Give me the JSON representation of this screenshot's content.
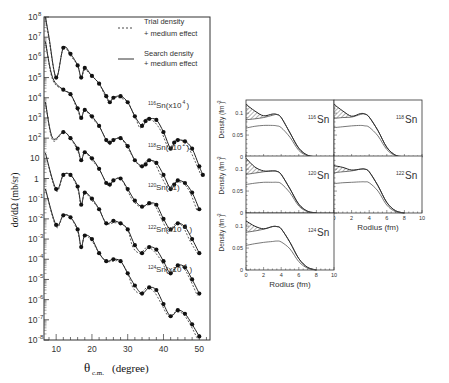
{
  "figure": {
    "left_panel": {
      "ylabel": "dσ/dΩ (mb/sr)",
      "xlabel_main": "θ",
      "xlabel_sub": "c.m.",
      "xlabel_unit": "(degree)",
      "x_ticks": [
        "10",
        "20",
        "30",
        "40",
        "50"
      ],
      "y_ticks": [
        {
          "base": "10",
          "exp": "8"
        },
        {
          "base": "10",
          "exp": "7"
        },
        {
          "base": "10",
          "exp": "6"
        },
        {
          "base": "10",
          "exp": "5"
        },
        {
          "base": "10",
          "exp": "4"
        },
        {
          "base": "10",
          "exp": "3"
        },
        {
          "base": "10",
          "exp": "2"
        },
        {
          "base": "10",
          "exp": ""
        },
        {
          "base": "1",
          "exp": ""
        },
        {
          "base": "10",
          "exp": "-1"
        },
        {
          "base": "10",
          "exp": "-2"
        },
        {
          "base": "10",
          "exp": "-3"
        },
        {
          "base": "10",
          "exp": "-4"
        },
        {
          "base": "10",
          "exp": "-5"
        },
        {
          "base": "10",
          "exp": "-6"
        },
        {
          "base": "10",
          "exp": "-7"
        },
        {
          "base": "10",
          "exp": "-8"
        }
      ],
      "legend": {
        "trial_line1": "Trial density",
        "trial_line2": "+ medium effect",
        "search_line1": "Search density",
        "search_line2": "+ medium effect"
      },
      "curve_labels": [
        {
          "mass": "116",
          "text": "Sn(x10",
          "exp": "4",
          ")": ")"
        },
        {
          "mass": "118",
          "text": "Sn(x10",
          "exp": "2"
        },
        {
          "mass": "120",
          "text": "Sn(x1)",
          "exp": ""
        },
        {
          "mass": "122",
          "text": "Sn(x10",
          "exp": "-2"
        },
        {
          "mass": "124",
          "text": "Sn(x10",
          "exp": "-4"
        }
      ]
    },
    "density_panels": {
      "ylabel": "Density (fm",
      "ylabel_exp": "-3",
      "xlabel": "Rodius (fm)",
      "y_ticks": [
        "0",
        "0.05",
        "0.1"
      ],
      "x_ticks": [
        "0",
        "2",
        "4",
        "6",
        "8",
        "10"
      ],
      "panels": [
        {
          "mass": "116",
          "element": "Sn"
        },
        {
          "mass": "118",
          "element": "Sn"
        },
        {
          "mass": "120",
          "element": "Sn"
        },
        {
          "mass": "122",
          "element": "Sn"
        },
        {
          "mass": "124",
          "element": "Sn"
        }
      ]
    }
  },
  "chart_data": [
    {
      "type": "scatter",
      "title": "Elastic scattering differential cross sections, Sn isotopes",
      "xlabel": "θ_c.m. (degree)",
      "ylabel": "dσ/dΩ (mb/sr)",
      "xlim": [
        6.6,
        53
      ],
      "ylim": [
        1e-08,
        100000000.0
      ],
      "yscale": "log",
      "legend": [
        "Trial density + medium effect (dashed)",
        "Search density + medium effect (solid)"
      ],
      "series": [
        {
          "name": "116Sn (x10^4)",
          "scale": 10000,
          "x": [
            8,
            10,
            12,
            14,
            16,
            17,
            18,
            20,
            22,
            24,
            25,
            26,
            28,
            30,
            32,
            34,
            35,
            36,
            38,
            40,
            42,
            43,
            44,
            46,
            48,
            50,
            51
          ],
          "y": [
            10000000.0,
            100000.0,
            3000000.0,
            1500000.0,
            400000.0,
            100000.0,
            300000.0,
            120000.0,
            50000.0,
            12000.0,
            6000.0,
            10000.0,
            12000.0,
            6000.0,
            1200.0,
            400.0,
            700.0,
            900.0,
            800.0,
            200.0,
            30,
            60,
            80,
            70,
            30,
            4,
            1.5
          ]
        },
        {
          "name": "118Sn (x10^2)",
          "scale": 100,
          "x": [
            9,
            12,
            14,
            16,
            17,
            18,
            20,
            22,
            24,
            25,
            26,
            28,
            30,
            32,
            34,
            35,
            36,
            38,
            40,
            42,
            43,
            44,
            46,
            48,
            50
          ],
          "y": [
            100000.0,
            25000.0,
            15000.0,
            3000.0,
            1000.0,
            2500.0,
            1200.0,
            400.0,
            80,
            60,
            80,
            100.0,
            40,
            8,
            4,
            5,
            8,
            6,
            1.5,
            0.3,
            0.5,
            0.8,
            0.6,
            0.2,
            0.03
          ]
        },
        {
          "name": "120Sn (x1)",
          "scale": 1,
          "x": [
            9,
            12,
            14,
            16,
            17,
            18,
            20,
            22,
            24,
            25,
            26,
            28,
            30,
            32,
            34,
            36,
            38,
            40,
            42,
            44,
            46,
            48,
            50
          ],
          "y": [
            100.0,
            200.0,
            100.0,
            30,
            8,
            20,
            10,
            3,
            0.6,
            0.5,
            0.8,
            1,
            0.3,
            0.08,
            0.04,
            0.06,
            0.05,
            0.01,
            0.003,
            0.006,
            0.004,
            0.001,
            0.0002
          ]
        },
        {
          "name": "122Sn (x10^-2)",
          "scale": 0.01,
          "x": [
            10,
            12,
            14,
            16,
            17,
            18,
            20,
            22,
            24,
            26,
            28,
            30,
            32,
            34,
            36,
            38,
            40,
            42,
            44,
            46,
            48,
            50
          ],
          "y": [
            0.3,
            1.5,
            1.5,
            0.4,
            0.05,
            0.2,
            0.1,
            0.03,
            0.006,
            0.008,
            0.006,
            0.003,
            0.0005,
            0.0002,
            0.0004,
            0.0003,
            8e-05,
            2e-05,
            5e-05,
            4e-05,
            1e-05,
            2e-06
          ]
        },
        {
          "name": "124Sn (x10^-4)",
          "scale": 0.0001,
          "x": [
            10,
            12,
            14,
            16,
            17,
            18,
            20,
            22,
            24,
            26,
            28,
            30,
            32,
            34,
            36,
            38,
            40,
            42,
            44,
            46,
            48,
            50
          ],
          "y": [
            0.005,
            0.015,
            0.012,
            0.003,
            0.0004,
            0.0015,
            0.001,
            0.0002,
            8e-05,
            0.0001,
            8e-05,
            2e-05,
            5e-06,
            2e-06,
            4e-06,
            3e-06,
            6e-07,
            1.5e-07,
            3e-07,
            2e-07,
            6e-08,
            1.5e-08
          ]
        }
      ]
    },
    {
      "type": "line",
      "title": "Nuclear density distributions",
      "xlabel": "Rodius (fm)",
      "ylabel": "Density (fm^-3)",
      "xlim": [
        0,
        10
      ],
      "ylim": [
        0,
        0.13
      ],
      "panels": [
        {
          "name": "116Sn",
          "r": [
            0,
            1,
            2,
            3,
            3.5,
            4,
            5,
            6,
            7,
            8
          ],
          "search": [
            0.12,
            0.105,
            0.094,
            0.098,
            0.097,
            0.09,
            0.055,
            0.02,
            0.004,
            0
          ],
          "trial": [
            0.085,
            0.087,
            0.09,
            0.095,
            0.097,
            0.09,
            0.055,
            0.02,
            0.004,
            0
          ],
          "point": [
            0.066,
            0.07,
            0.072,
            0.072,
            0.071,
            0.067,
            0.045,
            0.015,
            0.003,
            0
          ]
        },
        {
          "name": "118Sn",
          "r": [
            0,
            1,
            2,
            3,
            3.5,
            4,
            5,
            6,
            7,
            8
          ],
          "search": [
            0.12,
            0.105,
            0.093,
            0.099,
            0.098,
            0.091,
            0.06,
            0.022,
            0.004,
            0
          ],
          "trial": [
            0.088,
            0.09,
            0.091,
            0.097,
            0.098,
            0.091,
            0.06,
            0.022,
            0.004,
            0
          ],
          "point": [
            0.067,
            0.069,
            0.071,
            0.072,
            0.071,
            0.068,
            0.048,
            0.017,
            0.003,
            0
          ]
        },
        {
          "name": "120Sn",
          "r": [
            0,
            1,
            2,
            3,
            3.5,
            4,
            5,
            6,
            7,
            8
          ],
          "search": [
            0.125,
            0.105,
            0.096,
            0.096,
            0.095,
            0.088,
            0.055,
            0.02,
            0.004,
            0
          ],
          "trial": [
            0.088,
            0.091,
            0.094,
            0.096,
            0.095,
            0.088,
            0.055,
            0.02,
            0.004,
            0
          ],
          "point": [
            0.065,
            0.068,
            0.07,
            0.07,
            0.07,
            0.067,
            0.046,
            0.016,
            0.003,
            0
          ]
        },
        {
          "name": "122Sn",
          "r": [
            0,
            1,
            2,
            3,
            3.5,
            4,
            5,
            6,
            7,
            8
          ],
          "search": [
            0.108,
            0.104,
            0.098,
            0.1,
            0.1,
            0.094,
            0.062,
            0.024,
            0.005,
            0
          ],
          "trial": [
            0.092,
            0.094,
            0.096,
            0.1,
            0.1,
            0.094,
            0.062,
            0.024,
            0.005,
            0
          ],
          "point": [
            0.067,
            0.069,
            0.07,
            0.071,
            0.071,
            0.069,
            0.05,
            0.018,
            0.003,
            0
          ]
        },
        {
          "name": "124Sn",
          "r": [
            0,
            1,
            2,
            3,
            3.5,
            4,
            5,
            6,
            7,
            8
          ],
          "search": [
            0.112,
            0.1,
            0.094,
            0.099,
            0.099,
            0.094,
            0.063,
            0.026,
            0.006,
            0
          ],
          "trial": [
            0.086,
            0.089,
            0.093,
            0.099,
            0.099,
            0.094,
            0.063,
            0.026,
            0.006,
            0
          ],
          "point": [
            0.056,
            0.06,
            0.063,
            0.065,
            0.066,
            0.064,
            0.048,
            0.019,
            0.004,
            0
          ]
        }
      ]
    }
  ]
}
